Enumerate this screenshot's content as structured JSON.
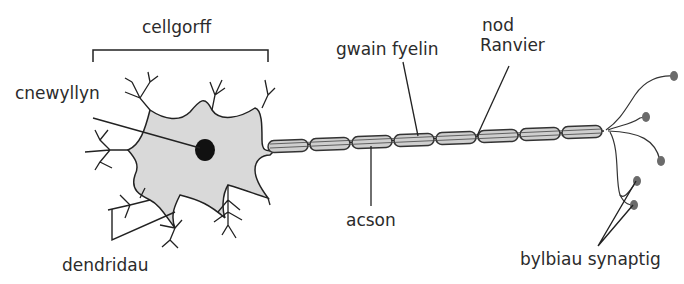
{
  "diagram": {
    "colors": {
      "cell_fill": "#d9d9d9",
      "stroke": "#222222",
      "myelin_fill": "#cfcfcf",
      "terminal": "#6b6b6b"
    },
    "labels": {
      "cell_body": "cellgorff",
      "nucleus": "cnewyllyn",
      "myelin_sheath": "gwain fyelin",
      "node_line1": "nod",
      "node_line2": "Ranvier",
      "axon": "acson",
      "dendrites": "dendridau",
      "synaptic_bulbs": "bylbiau synaptig"
    },
    "myelin_segments": 8
  }
}
